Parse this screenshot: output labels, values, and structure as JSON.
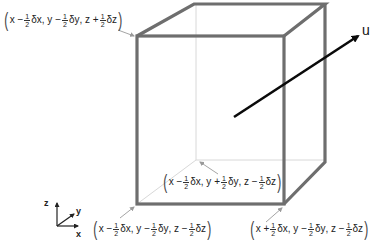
{
  "diagram": {
    "colors": {
      "cube_edge": "#6e6e6e",
      "hidden_edge": "#d8d8d8",
      "arrow": "#0a0a0a",
      "leader": "#9a9a9a",
      "text": "#222222"
    },
    "vector": {
      "label": "u"
    },
    "axes": {
      "z": "z",
      "y": "y",
      "x": "x"
    },
    "corners": [
      {
        "id": "top-left-front",
        "x_sign": "−",
        "x_var": "x",
        "x_delta": "δx",
        "y_sign": "−",
        "y_var": "y",
        "y_delta": "δy",
        "z_sign": "+",
        "z_var": "z",
        "z_delta": "δz",
        "frac_num": "1",
        "frac_den": "2"
      },
      {
        "id": "bottom-left-back",
        "x_sign": "−",
        "x_var": "x",
        "x_delta": "δx",
        "y_sign": "+",
        "y_var": "y",
        "y_delta": "δy",
        "z_sign": "−",
        "z_var": "z",
        "z_delta": "δz",
        "frac_num": "1",
        "frac_den": "2"
      },
      {
        "id": "bottom-left-front",
        "x_sign": "−",
        "x_var": "x",
        "x_delta": "δx",
        "y_sign": "−",
        "y_var": "y",
        "y_delta": "δy",
        "z_sign": "−",
        "z_var": "z",
        "z_delta": "δz",
        "frac_num": "1",
        "frac_den": "2"
      },
      {
        "id": "bottom-right-front",
        "x_sign": "+",
        "x_var": "x",
        "x_delta": "δx",
        "y_sign": "−",
        "y_var": "y",
        "y_delta": "δy",
        "z_sign": "−",
        "z_var": "z",
        "z_delta": "δz",
        "frac_num": "1",
        "frac_den": "2"
      }
    ]
  }
}
